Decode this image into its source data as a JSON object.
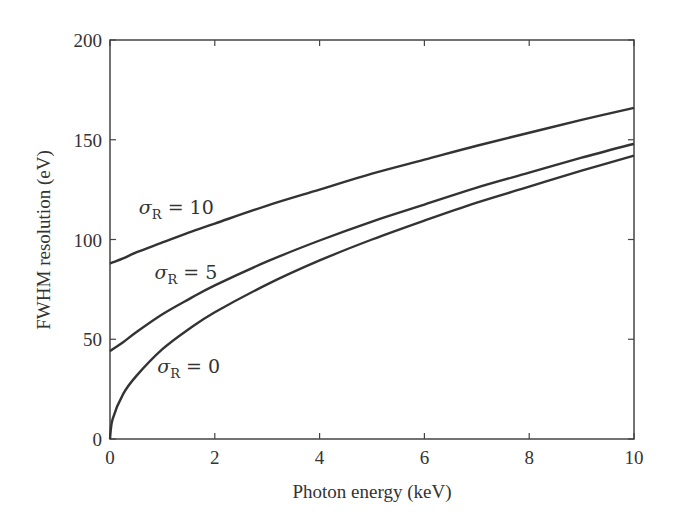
{
  "chart_data": {
    "type": "line",
    "title": "",
    "xlabel": "Photon energy  (keV)",
    "ylabel": "FWHM resolution  (eV)",
    "xlim": [
      0,
      10
    ],
    "ylim": [
      0,
      200
    ],
    "xticks": [
      0,
      2,
      4,
      6,
      8,
      10
    ],
    "yticks": [
      0,
      50,
      100,
      150,
      200
    ],
    "grid": false,
    "legend": "none (inline annotations)",
    "x": [
      0,
      0.05,
      0.25,
      0.5,
      1,
      1.5,
      2,
      3,
      4,
      5,
      6,
      7,
      8,
      9,
      10
    ],
    "series": [
      {
        "name": "σR = 10",
        "values": [
          88,
          88.5,
          90.5,
          93.5,
          98.5,
          103.5,
          108,
          117,
          125,
          133,
          140,
          147,
          153.5,
          160,
          166
        ]
      },
      {
        "name": "σR = 5",
        "values": [
          44,
          45,
          48.5,
          53.5,
          62.5,
          70,
          77,
          89,
          99.5,
          109,
          117.5,
          126,
          133.5,
          141,
          148
        ]
      },
      {
        "name": "σR = 0",
        "values": [
          0,
          10,
          22.5,
          31.5,
          45,
          55,
          63.5,
          77.5,
          89.5,
          100,
          109.5,
          118.5,
          126.5,
          134.5,
          142
        ]
      }
    ],
    "annotations": [
      {
        "text_main": "σ",
        "text_sub": "R",
        "text_rest": " = 10",
        "x": 0.55,
        "y": 113,
        "series": "σR = 10"
      },
      {
        "text_main": "σ",
        "text_sub": "R",
        "text_rest": " = 5",
        "x": 0.85,
        "y": 80,
        "series": "σR = 5"
      },
      {
        "text_main": "σ",
        "text_sub": "R",
        "text_rest": " = 0",
        "x": 0.9,
        "y": 33,
        "series": "σR = 0"
      }
    ]
  },
  "colors": {
    "line": "#333333",
    "axis": "#444444",
    "background": "#ffffff"
  }
}
